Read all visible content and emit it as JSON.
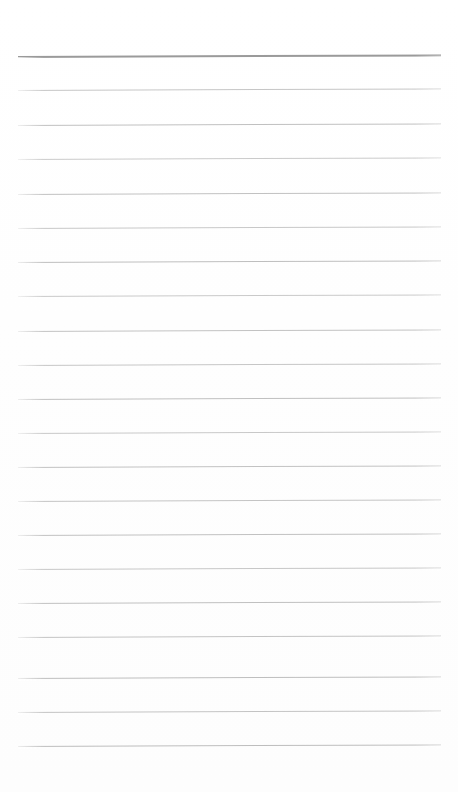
{
  "document": {
    "kind": "scanned-blank-lined-page",
    "title": "Blank Lined Notebook Page",
    "page_width": 458,
    "page_height": 792,
    "background_color": "#ffffff",
    "paper_tint": "#fefefe",
    "has_text_content": false,
    "has_handwriting": false,
    "has_header": false,
    "has_footer": false,
    "has_page_number": false,
    "has_margin_rule": false,
    "text_blocks": []
  },
  "ruling": {
    "description": "Horizontal ruled writing lines of a blank notebook page",
    "line_count": 21,
    "first_line_y": 56,
    "line_spacing": 34.5,
    "left_x": 18,
    "right_x": 441,
    "line_length": 423,
    "tilt_degrees": -0.22,
    "default_color": "#c0c0c0",
    "default_thickness": 1,
    "header_rule_color": "#9a9a9a",
    "header_rule_thickness": 2,
    "lines": [
      {
        "index": 1,
        "y": 56,
        "color": "#9a9a9a",
        "thickness": 2,
        "opacity": 1.0,
        "emphasis": "header-rule"
      },
      {
        "index": 2,
        "y": 90,
        "color": "#c3c3c3",
        "thickness": 1,
        "opacity": 0.95,
        "emphasis": "normal"
      },
      {
        "index": 3,
        "y": 125,
        "color": "#bdbdbd",
        "thickness": 1,
        "opacity": 0.95,
        "emphasis": "normal"
      },
      {
        "index": 4,
        "y": 159,
        "color": "#c6c6c6",
        "thickness": 1,
        "opacity": 0.92,
        "emphasis": "normal"
      },
      {
        "index": 5,
        "y": 194,
        "color": "#bebebe",
        "thickness": 1,
        "opacity": 0.95,
        "emphasis": "normal"
      },
      {
        "index": 6,
        "y": 228,
        "color": "#c4c4c4",
        "thickness": 1,
        "opacity": 0.93,
        "emphasis": "normal"
      },
      {
        "index": 7,
        "y": 262,
        "color": "#bcbcbc",
        "thickness": 1,
        "opacity": 0.96,
        "emphasis": "normal"
      },
      {
        "index": 8,
        "y": 296,
        "color": "#c5c5c5",
        "thickness": 1,
        "opacity": 0.92,
        "emphasis": "normal"
      },
      {
        "index": 9,
        "y": 331,
        "color": "#bfbfbf",
        "thickness": 1,
        "opacity": 0.95,
        "emphasis": "normal"
      },
      {
        "index": 10,
        "y": 365,
        "color": "#c2c2c2",
        "thickness": 1,
        "opacity": 0.93,
        "emphasis": "normal"
      },
      {
        "index": 11,
        "y": 399,
        "color": "#bdbdbd",
        "thickness": 1,
        "opacity": 0.95,
        "emphasis": "normal"
      },
      {
        "index": 12,
        "y": 433,
        "color": "#c4c4c4",
        "thickness": 1,
        "opacity": 0.92,
        "emphasis": "normal"
      },
      {
        "index": 13,
        "y": 467,
        "color": "#bfbfbf",
        "thickness": 1,
        "opacity": 0.95,
        "emphasis": "normal"
      },
      {
        "index": 14,
        "y": 501,
        "color": "#c1c1c1",
        "thickness": 1,
        "opacity": 0.94,
        "emphasis": "normal"
      },
      {
        "index": 15,
        "y": 535,
        "color": "#bebebe",
        "thickness": 1,
        "opacity": 0.95,
        "emphasis": "normal"
      },
      {
        "index": 16,
        "y": 569,
        "color": "#c3c3c3",
        "thickness": 1,
        "opacity": 0.93,
        "emphasis": "normal"
      },
      {
        "index": 17,
        "y": 603,
        "color": "#bdbdbd",
        "thickness": 1,
        "opacity": 0.95,
        "emphasis": "normal"
      },
      {
        "index": 18,
        "y": 637,
        "color": "#c0c0c0",
        "thickness": 1,
        "opacity": 0.94,
        "emphasis": "normal"
      },
      {
        "index": 19,
        "y": 678,
        "color": "#bcbcbc",
        "thickness": 1,
        "opacity": 0.96,
        "emphasis": "normal"
      },
      {
        "index": 20,
        "y": 712,
        "color": "#c0c0c0",
        "thickness": 1,
        "opacity": 0.94,
        "emphasis": "normal"
      },
      {
        "index": 21,
        "y": 746,
        "color": "#bbbbbb",
        "thickness": 1,
        "opacity": 0.96,
        "emphasis": "normal"
      }
    ]
  },
  "margins": {
    "top_blank_height": 56,
    "bottom_blank_height": 46,
    "left_blank_width": 18,
    "right_blank_width": 17
  },
  "accessibility": {
    "caption": "Scanned blank lined notebook page with 21 horizontal ruled lines and no written content"
  }
}
